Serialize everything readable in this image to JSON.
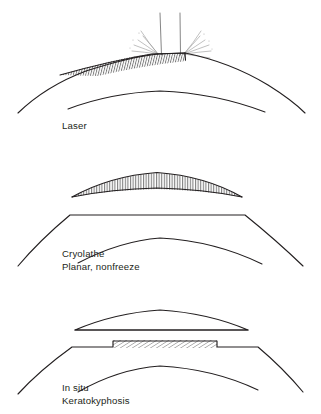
{
  "figure": {
    "background_color": "#ffffff",
    "line_color": "#231f20",
    "hatch_color": "#4a4a4a",
    "text_color": "#231f20",
    "width": 321,
    "height": 414
  },
  "panels": [
    {
      "id": "laser",
      "label_lines": [
        "Laser"
      ],
      "label_x": 62,
      "label_y": 129,
      "description": "Curved cornea with tapered hatched ablation zone at apex and ablation plume",
      "has_plume": true,
      "hatch_style": "vertical-tapered",
      "cornea_shape": "curved"
    },
    {
      "id": "cryolathe",
      "label_lines": [
        "Cryolathe",
        "Planar, nonfreeze"
      ],
      "label_x": 62,
      "label_y": 257,
      "description": "Lens-shaped hatched lenticule above a flat-topped cornea",
      "has_plume": false,
      "hatch_style": "vertical",
      "cornea_shape": "planar-top"
    },
    {
      "id": "in-situ",
      "label_lines": [
        "In situ",
        "Keratokyphosis"
      ],
      "label_x": 62,
      "label_y": 391,
      "description": "Flat-bottomed lenticule above a recessed diagonally hatched stromal trough",
      "has_plume": false,
      "hatch_style": "diagonal",
      "cornea_shape": "planar-top-recessed"
    }
  ],
  "labels": {
    "laser": "Laser",
    "cryolathe_1": "Cryolathe",
    "cryolathe_2": "Planar, nonfreeze",
    "insitu_1": "In situ",
    "insitu_2": "Keratokyphosis"
  }
}
